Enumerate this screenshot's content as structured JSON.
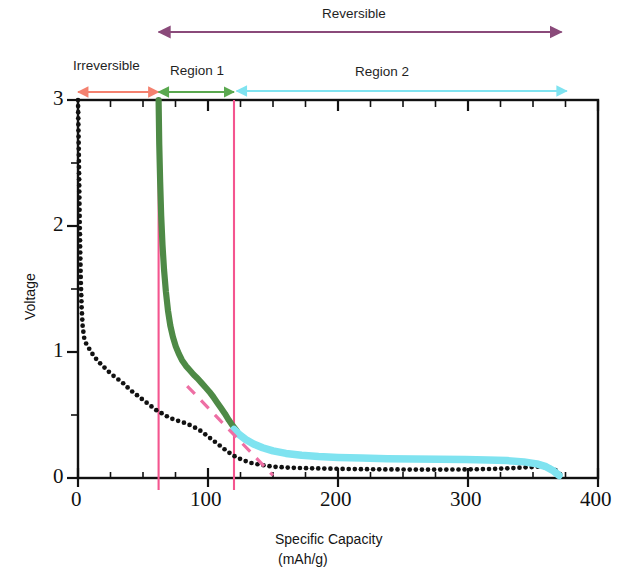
{
  "figure": {
    "annotations": {
      "reversible": "Reversible",
      "irreversible": "Irreversible",
      "region1": "Region 1",
      "region2": "Region 2"
    },
    "colors": {
      "reversible_arrow": "#8a4a7a",
      "irreversible_arrow": "#f4816f",
      "region1_arrow": "#5aa84f",
      "region2_arrow": "#7fe3f0",
      "discharge_curve": "#111111",
      "charge_region1": "#4e8a46",
      "charge_region2": "#7fe3f0",
      "boundary_line": "#f4558f",
      "tangent_line": "#ee6fa4",
      "axis": "#111111"
    }
  },
  "chart_data": {
    "type": "line",
    "title": "",
    "xlabel": "Specific Capacity",
    "xlabel_units": "(mAh/g)",
    "ylabel": "Voltage",
    "xlim": [
      0,
      400
    ],
    "ylim": [
      0,
      3
    ],
    "xticks": [
      0,
      100,
      200,
      300,
      400
    ],
    "xtick_labels": [
      "0",
      "100",
      "200",
      "300",
      "400"
    ],
    "xminor_tick_step": 25,
    "yticks": [
      0,
      1,
      2,
      3
    ],
    "ytick_labels": [
      "0",
      "1",
      "2",
      "3"
    ],
    "yminor_tick_step": 0.5,
    "grid": false,
    "legend": "none",
    "boundaries": [
      {
        "name": "irreversible-region1-boundary",
        "x": 62
      },
      {
        "name": "region1-region2-boundary",
        "x": 120
      }
    ],
    "span_arrows": [
      {
        "name": "reversible",
        "label": "Reversible",
        "x_start": 62,
        "x_end": 372,
        "color": "#8a4a7a",
        "row": "top"
      },
      {
        "name": "irreversible",
        "label": "Irreversible",
        "x_start": 0,
        "x_end": 62,
        "color": "#f4816f",
        "row": "axis"
      },
      {
        "name": "region1",
        "label": "Region 1",
        "x_start": 62,
        "x_end": 120,
        "color": "#5aa84f",
        "row": "axis"
      },
      {
        "name": "region2",
        "label": "Region 2",
        "x_start": 122,
        "x_end": 376,
        "color": "#7fe3f0",
        "row": "axis"
      }
    ],
    "series": [
      {
        "name": "discharge",
        "style": "dotted",
        "color": "#111111",
        "points": [
          [
            0,
            3.0
          ],
          [
            0.6,
            2.6
          ],
          [
            1.1,
            2.2
          ],
          [
            1.6,
            1.85
          ],
          [
            2.2,
            1.55
          ],
          [
            2.8,
            1.35
          ],
          [
            3.6,
            1.2
          ],
          [
            4.8,
            1.11
          ],
          [
            6.5,
            1.06
          ],
          [
            9,
            1.02
          ],
          [
            12,
            0.97
          ],
          [
            16,
            0.92
          ],
          [
            20,
            0.88
          ],
          [
            25,
            0.83
          ],
          [
            30,
            0.79
          ],
          [
            35,
            0.75
          ],
          [
            40,
            0.7
          ],
          [
            45,
            0.66
          ],
          [
            50,
            0.62
          ],
          [
            55,
            0.58
          ],
          [
            60,
            0.54
          ],
          [
            65,
            0.51
          ],
          [
            70,
            0.48
          ],
          [
            75,
            0.46
          ],
          [
            80,
            0.445
          ],
          [
            85,
            0.425
          ],
          [
            90,
            0.4
          ],
          [
            95,
            0.37
          ],
          [
            100,
            0.33
          ],
          [
            105,
            0.29
          ],
          [
            110,
            0.25
          ],
          [
            115,
            0.21
          ],
          [
            120,
            0.175
          ],
          [
            126,
            0.145
          ],
          [
            133,
            0.12
          ],
          [
            140,
            0.105
          ],
          [
            150,
            0.09
          ],
          [
            162,
            0.082
          ],
          [
            175,
            0.078
          ],
          [
            190,
            0.075
          ],
          [
            205,
            0.072
          ],
          [
            220,
            0.07
          ],
          [
            240,
            0.068
          ],
          [
            260,
            0.067
          ],
          [
            280,
            0.067
          ],
          [
            300,
            0.068
          ],
          [
            318,
            0.072
          ],
          [
            333,
            0.078
          ],
          [
            345,
            0.085
          ],
          [
            355,
            0.09
          ],
          [
            362,
            0.085
          ],
          [
            368,
            0.06
          ],
          [
            372,
            0.02
          ]
        ]
      },
      {
        "name": "charge-region-1",
        "style": "solid-thick",
        "color": "#4e8a46",
        "points": [
          [
            62,
            3.0
          ],
          [
            62.5,
            2.65
          ],
          [
            63.2,
            2.35
          ],
          [
            64,
            2.08
          ],
          [
            65,
            1.85
          ],
          [
            66.2,
            1.65
          ],
          [
            67.6,
            1.48
          ],
          [
            69.2,
            1.33
          ],
          [
            71,
            1.21
          ],
          [
            73,
            1.12
          ],
          [
            75.2,
            1.045
          ],
          [
            77.6,
            0.985
          ],
          [
            80,
            0.935
          ],
          [
            83,
            0.89
          ],
          [
            86,
            0.855
          ],
          [
            89,
            0.82
          ],
          [
            92,
            0.79
          ],
          [
            95,
            0.755
          ],
          [
            98,
            0.72
          ],
          [
            101,
            0.685
          ],
          [
            104,
            0.645
          ],
          [
            107,
            0.6
          ],
          [
            110,
            0.555
          ],
          [
            113,
            0.51
          ],
          [
            116,
            0.46
          ],
          [
            119,
            0.415
          ],
          [
            122,
            0.375
          ]
        ]
      },
      {
        "name": "charge-region-2",
        "style": "solid-thick",
        "color": "#7fe3f0",
        "points": [
          [
            120,
            0.385
          ],
          [
            124,
            0.345
          ],
          [
            129,
            0.305
          ],
          [
            135,
            0.27
          ],
          [
            142,
            0.24
          ],
          [
            150,
            0.215
          ],
          [
            160,
            0.195
          ],
          [
            172,
            0.18
          ],
          [
            185,
            0.17
          ],
          [
            200,
            0.163
          ],
          [
            218,
            0.158
          ],
          [
            238,
            0.153
          ],
          [
            258,
            0.15
          ],
          [
            278,
            0.148
          ],
          [
            298,
            0.146
          ],
          [
            315,
            0.143
          ],
          [
            330,
            0.138
          ],
          [
            343,
            0.128
          ],
          [
            353,
            0.112
          ],
          [
            360,
            0.09
          ],
          [
            366,
            0.055
          ],
          [
            370,
            0.02
          ]
        ]
      },
      {
        "name": "tangent-guide",
        "style": "dashed",
        "color": "#ee6fa4",
        "points": [
          [
            84,
            0.73
          ],
          [
            150,
            0.02
          ]
        ]
      }
    ]
  }
}
